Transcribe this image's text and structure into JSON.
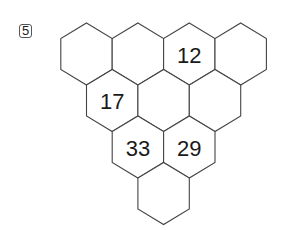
{
  "problem_number": "5",
  "grid": {
    "rows": [
      {
        "cells": [
          "",
          "",
          "12",
          ""
        ]
      },
      {
        "cells": [
          "17",
          "",
          ""
        ]
      },
      {
        "cells": [
          "33",
          "29"
        ]
      },
      {
        "cells": [
          ""
        ]
      }
    ]
  },
  "colors": {
    "stroke": "#444444",
    "text": "#1a1a1a",
    "background": "#ffffff"
  }
}
